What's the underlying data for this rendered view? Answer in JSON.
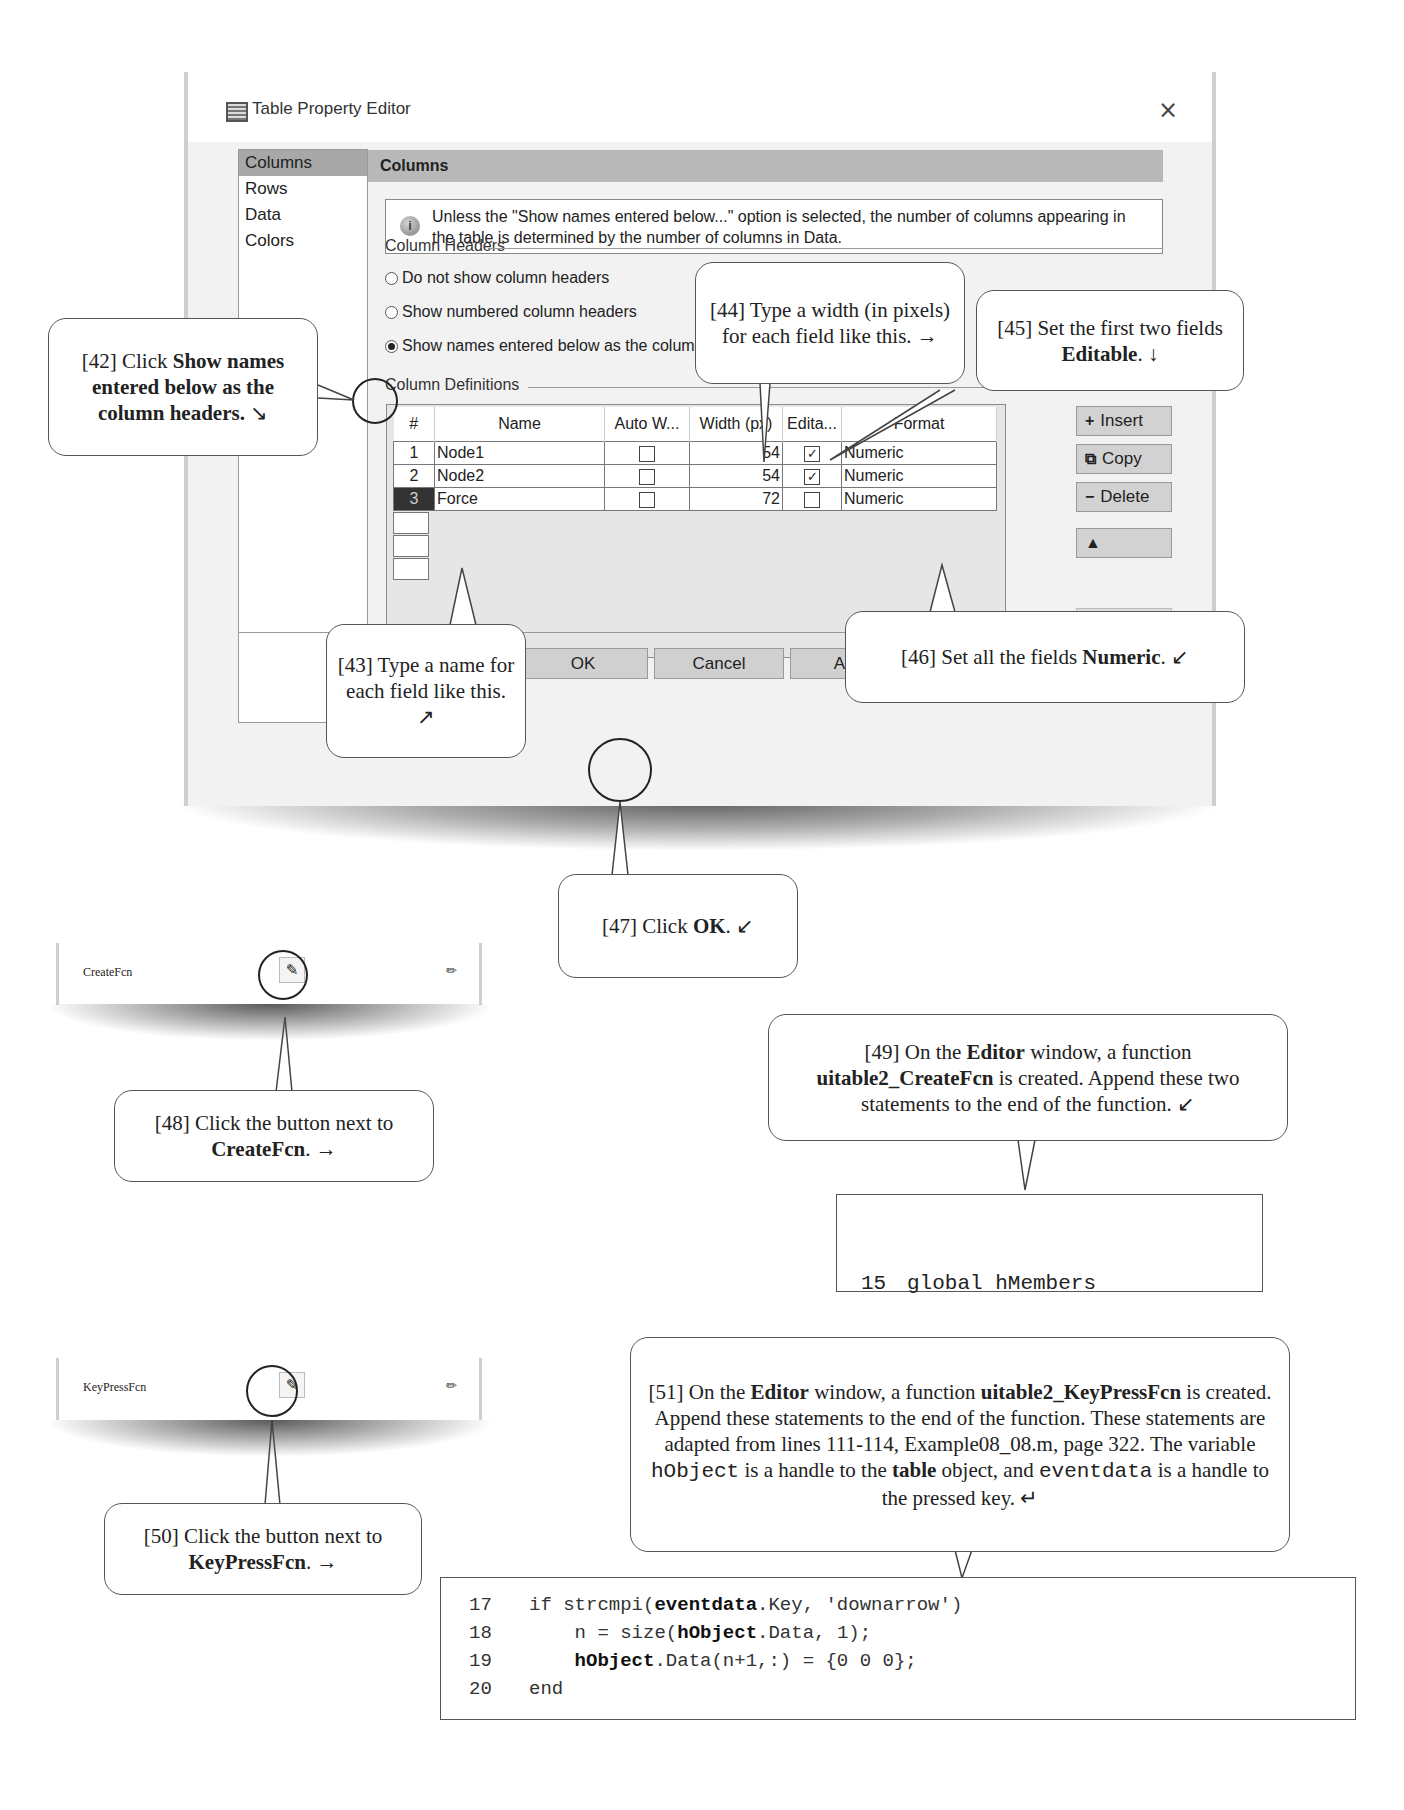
{
  "dialog": {
    "title": "Table Property Editor",
    "close_icon": "×",
    "nav": [
      "Columns",
      "Rows",
      "Data",
      "Colors"
    ],
    "nav_active": "Columns",
    "section_title": "Columns",
    "info_text": "Unless the \"Show names entered below...\" option is selected, the number of columns appearing in the table is determined by the number of columns in Data.",
    "column_headers_group": "Column Headers",
    "radio_options": [
      {
        "label": "Do not show column headers",
        "checked": false
      },
      {
        "label": "Show numbered column headers",
        "checked": false
      },
      {
        "label": "Show names entered below as the column headers:",
        "checked": true
      }
    ],
    "column_definitions_group": "Column Definitions",
    "table": {
      "headers": [
        "#",
        "Name",
        "Auto W...",
        "Width (px)",
        "Edita...",
        "Format"
      ],
      "rows": [
        {
          "num": "1",
          "name": "Node1",
          "auto_width": false,
          "width": "54",
          "editable": true,
          "format": "Numeric",
          "selected": false
        },
        {
          "num": "2",
          "name": "Node2",
          "auto_width": false,
          "width": "54",
          "editable": true,
          "format": "Numeric",
          "selected": false
        },
        {
          "num": "3",
          "name": "Force",
          "auto_width": false,
          "width": "72",
          "editable": false,
          "format": "Numeric",
          "selected": true
        }
      ]
    },
    "side_buttons": [
      {
        "icon": "+",
        "label": "Insert"
      },
      {
        "icon": "⧉",
        "label": "Copy"
      },
      {
        "icon": "−",
        "label": "Delete"
      },
      {
        "icon": "▲",
        "label": ""
      },
      {
        "icon": "⚙",
        "label": "Edit..."
      }
    ],
    "footer_buttons": [
      "OK",
      "Cancel",
      "Apply",
      "Help"
    ]
  },
  "callouts": {
    "c42": {
      "prefix": "[42] Click ",
      "bold": "Show names entered below as the column headers.",
      "suffix": " ↘"
    },
    "c43": {
      "text": "[43] Type a name for each field like this. ↗"
    },
    "c44": {
      "text": "[44] Type a width (in pixels) for each field like this. →"
    },
    "c45": {
      "prefix": "[45] Set the first two fields ",
      "bold": "Editable",
      "suffix": ". ↓"
    },
    "c46": {
      "prefix": "[46] Set all the fields ",
      "bold": "Numeric",
      "suffix": ". ↙"
    },
    "c47": {
      "prefix": "[47] Click ",
      "bold": "OK",
      "suffix": ". ↙"
    },
    "c48": {
      "prefix": "[48] Click the button next to ",
      "bold": "CreateFcn",
      "suffix": ". →"
    },
    "c49": {
      "p1": "[49] On the ",
      "b1": "Editor",
      "p2": " window, a function ",
      "b2": "uitable2_CreateFcn",
      "p3": " is created.  Append these two statements to the end of the function. ↙"
    },
    "c50": {
      "prefix": "[50] Click the button next to ",
      "bold": "KeyPressFcn",
      "suffix": ". →"
    },
    "c51": {
      "p1": "[51] On the ",
      "b1": "Editor",
      "p2": " window, a function ",
      "b2": "uitable2_KeyPressFcn",
      "p3": " is created.  Append these statements to the end of the function.  These statements are adapted from lines 111-114, Example08_08.m, page 322.  The variable ",
      "m1": "hObject",
      "p4": " is a handle to the ",
      "b3": "table",
      "p5": " object, and ",
      "m2": "eventdata",
      "p6": " is a handle to the pressed key. ↵"
    }
  },
  "property_strips": [
    {
      "label": "CreateFcn",
      "button_icon": "callback-editor-icon",
      "edit_icon": "pencil-icon"
    },
    {
      "label": "KeyPressFcn",
      "button_icon": "callback-editor-icon",
      "edit_icon": "pencil-icon"
    }
  ],
  "code_create": [
    {
      "ln": "15",
      "code": "global hMembers"
    },
    {
      "ln": "16",
      "code": "hMembers = hObject;"
    }
  ],
  "code_keypress": [
    {
      "ln": "17",
      "parts": [
        [
          "if strcmpi(",
          false
        ],
        [
          "eventdata",
          true
        ],
        [
          ".Key, 'downarrow')",
          false
        ]
      ]
    },
    {
      "ln": "18",
      "parts": [
        [
          "    n = size(",
          false
        ],
        [
          "hObject",
          true
        ],
        [
          ".Data, 1);",
          false
        ]
      ]
    },
    {
      "ln": "19",
      "parts": [
        [
          "    ",
          false
        ],
        [
          "hObject",
          true
        ],
        [
          ".Data(n+1,:) = {0 0 0};",
          false
        ]
      ]
    },
    {
      "ln": "20",
      "parts": [
        [
          "end",
          false
        ]
      ]
    }
  ]
}
